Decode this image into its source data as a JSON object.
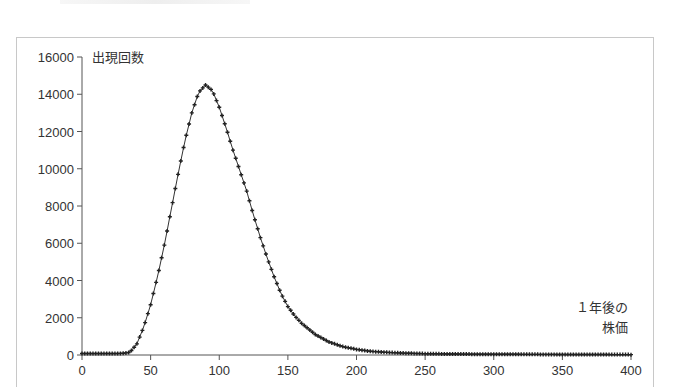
{
  "chart_data": {
    "type": "line",
    "title": "",
    "ylabel": "出現回数",
    "xlabel": "１年後の株価",
    "xlabel_lines": [
      "１年後の",
      "株価"
    ],
    "xlim": [
      0,
      400
    ],
    "ylim": [
      0,
      16000
    ],
    "x_ticks": [
      0,
      50,
      100,
      150,
      200,
      250,
      300,
      350,
      400
    ],
    "y_ticks": [
      0,
      2000,
      4000,
      6000,
      8000,
      10000,
      12000,
      14000,
      16000
    ],
    "grid": false,
    "legend": null,
    "marker": "+",
    "series": [
      {
        "name": "出現回数",
        "x": [
          0,
          5,
          10,
          15,
          20,
          25,
          30,
          35,
          40,
          45,
          50,
          55,
          60,
          65,
          70,
          75,
          80,
          85,
          90,
          95,
          100,
          105,
          110,
          115,
          120,
          125,
          130,
          135,
          140,
          145,
          150,
          155,
          160,
          165,
          170,
          175,
          180,
          190,
          200,
          210,
          220,
          235,
          250,
          275,
          300,
          325,
          350,
          375,
          400
        ],
        "values": [
          80,
          80,
          80,
          80,
          80,
          80,
          90,
          150,
          600,
          1500,
          2700,
          4200,
          5900,
          7800,
          9700,
          11500,
          13000,
          14100,
          14500,
          14200,
          13300,
          12200,
          11000,
          9900,
          8800,
          7500,
          6300,
          5200,
          4200,
          3300,
          2600,
          2100,
          1700,
          1400,
          1100,
          900,
          700,
          450,
          300,
          200,
          150,
          100,
          70,
          50,
          40,
          35,
          30,
          25,
          20
        ]
      }
    ]
  }
}
